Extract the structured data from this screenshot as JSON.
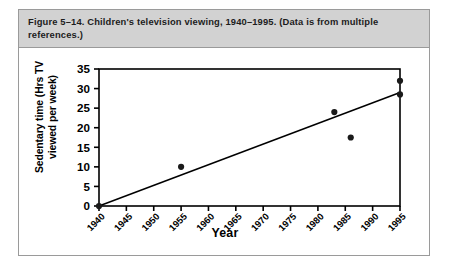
{
  "figure": {
    "caption": "Figure 5–14. Children's television viewing, 1940–1995. (Data is from multiple references.)"
  },
  "chart_data": {
    "type": "scatter",
    "title": "",
    "xlabel": "Year",
    "ylabel": "Sedentary time (Hrs TV viewed per week)",
    "ylabel_line1": "Sedentary time (Hrs TV",
    "ylabel_line2": "viewed per week)",
    "xlim": [
      1940,
      1995
    ],
    "ylim": [
      0,
      35
    ],
    "grid": false,
    "legend": "none",
    "x_ticks": [
      1940,
      1945,
      1950,
      1955,
      1960,
      1965,
      1970,
      1975,
      1980,
      1985,
      1990,
      1995
    ],
    "x_tick_labels": [
      "1940",
      "1945",
      "1950",
      "1955",
      "1960",
      "1965",
      "1970",
      "1975",
      "1980",
      "1985",
      "1990",
      "1995"
    ],
    "y_ticks": [
      0,
      5,
      10,
      15,
      20,
      25,
      30,
      35
    ],
    "y_tick_labels": [
      "0",
      "5",
      "10",
      "15",
      "20",
      "25",
      "30",
      "35"
    ],
    "points": [
      {
        "x": 1940,
        "y": 0
      },
      {
        "x": 1955,
        "y": 10
      },
      {
        "x": 1983,
        "y": 24
      },
      {
        "x": 1986,
        "y": 17.5
      },
      {
        "x": 1995,
        "y": 32
      },
      {
        "x": 1995,
        "y": 28.5
      }
    ],
    "trendline": {
      "label": "fitted line",
      "x_start": 1940,
      "y_start": 0,
      "x_end": 1995,
      "y_end": 29
    },
    "marker_color": "#1a1a1a",
    "line_color": "#000000",
    "axis_color": "#000000",
    "plot_background": "#ffffff"
  }
}
